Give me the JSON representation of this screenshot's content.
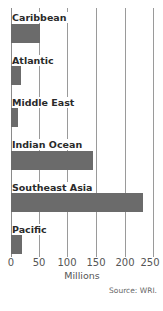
{
  "chart_data": {
    "type": "bar",
    "orientation": "horizontal",
    "title": "",
    "categories": [
      "Caribbean",
      "Atlantic",
      "Middle East",
      "Indian Ocean",
      "Southeast Asia",
      "Pacific"
    ],
    "values": [
      51,
      18,
      12,
      144,
      232,
      20
    ],
    "xlabel": "Millions",
    "ylabel": "",
    "xlim": [
      0,
      250
    ],
    "xticks": [
      "0",
      "50",
      "100",
      "150",
      "200",
      "250"
    ],
    "grid": true,
    "legend": null,
    "bar_color": "#6b6b6b",
    "source": "Source: WRI."
  }
}
